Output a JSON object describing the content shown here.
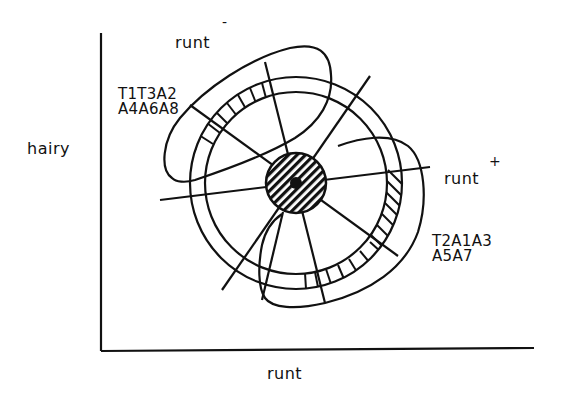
{
  "diagram": {
    "axes": {
      "y_label": "hairy",
      "x_label": "runt"
    },
    "lobes": [
      {
        "name": "runt",
        "superscript": "-",
        "genotypes": [
          "T1T3A2",
          "A4A6A8"
        ]
      },
      {
        "name": "runt",
        "superscript": "+",
        "genotypes": [
          "T2A1A3",
          "A5A7"
        ]
      }
    ],
    "center": {
      "x": 296,
      "y": 183
    },
    "radii": {
      "core": 30,
      "inner_ring": 91,
      "outer_ring": 106
    },
    "stroke_color": "#111111",
    "background_color": "#ffffff"
  }
}
